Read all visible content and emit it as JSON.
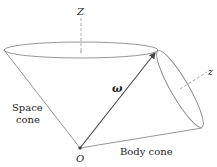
{
  "diagram": {
    "labels": {
      "space_axis": "Z",
      "body_axis": "z",
      "angular_velocity": "ω",
      "space_cone": [
        "Space",
        "cone"
      ],
      "body_cone": "Body cone",
      "origin": "O"
    },
    "colors": {
      "line": "#8a8a8a",
      "arrow": "#444444",
      "text": "#222222"
    }
  }
}
